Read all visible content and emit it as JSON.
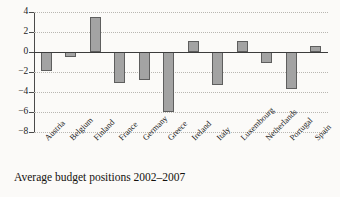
{
  "chart_data": {
    "type": "bar",
    "title": "",
    "caption": "Average budget positions 2002–2007",
    "xlabel": "",
    "ylabel": "",
    "ylim": [
      -8,
      4
    ],
    "yticks": [
      4,
      2,
      0,
      -2,
      -4,
      -6,
      -8
    ],
    "ytick_labels": [
      "4",
      "2",
      "0",
      "−2",
      "−4",
      "−6",
      "−8"
    ],
    "grid": true,
    "grid_style": "dotted-horizontal",
    "legend": "none",
    "categories": [
      "Austria",
      "Belgium",
      "Finland",
      "France",
      "Germany",
      "Greece",
      "Ireland",
      "Italy",
      "Luxembourg",
      "Netherlands",
      "Portugal",
      "Spain"
    ],
    "values": [
      -1.9,
      -0.5,
      3.5,
      -3.1,
      -2.8,
      -6.0,
      1.1,
      -3.3,
      1.1,
      -1.1,
      -3.7,
      0.6
    ],
    "bar_fill_color": "#a3a3a3",
    "bar_edge_color": "#5e5e5e",
    "axis_color": "#3c3c3c",
    "grid_color": "#b9b7b2",
    "background_color": "#fbfaf8"
  }
}
